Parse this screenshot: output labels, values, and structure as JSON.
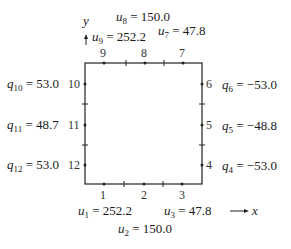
{
  "axes": {
    "x_label": "x",
    "y_label": "y"
  },
  "nodes": {
    "bottom": [
      "1",
      "2",
      "3"
    ],
    "right": [
      "4",
      "5",
      "6"
    ],
    "top": [
      "7",
      "8",
      "9"
    ],
    "left": [
      "10",
      "11",
      "12"
    ]
  },
  "values": {
    "u1": {
      "sym": "u",
      "sub": "1",
      "val": "252.2"
    },
    "u2": {
      "sym": "u",
      "sub": "2",
      "val": "150.0"
    },
    "u3": {
      "sym": "u",
      "sub": "3",
      "val": "47.8"
    },
    "q4": {
      "sym": "q",
      "sub": "4",
      "val": "−53.0"
    },
    "q5": {
      "sym": "q",
      "sub": "5",
      "val": "−48.8"
    },
    "q6": {
      "sym": "q",
      "sub": "6",
      "val": "−53.0"
    },
    "u7": {
      "sym": "u",
      "sub": "7",
      "val": "47.8"
    },
    "u8": {
      "sym": "u",
      "sub": "8",
      "val": "150.0"
    },
    "u9": {
      "sym": "u",
      "sub": "9",
      "val": "252.2"
    },
    "q10": {
      "sym": "q",
      "sub": "10",
      "val": "53.0"
    },
    "q11": {
      "sym": "q",
      "sub": "11",
      "val": "48.7"
    },
    "q12": {
      "sym": "q",
      "sub": "12",
      "val": "53.0"
    }
  }
}
